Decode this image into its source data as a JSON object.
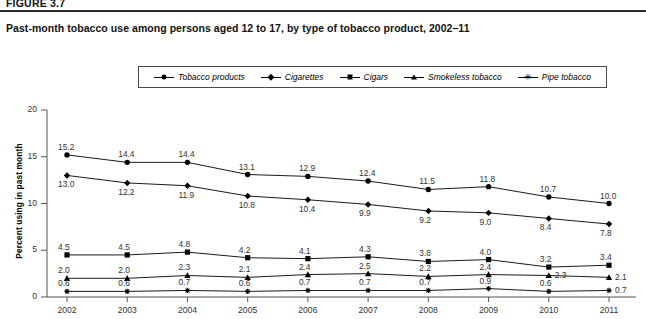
{
  "figure": {
    "label": "FIGURE 3.7",
    "title": "Past-month tobacco use among persons aged 12 to 17, by type of tobacco product, 2002–11"
  },
  "legend": {
    "position": "top-center",
    "items": [
      {
        "label": "Tobacco products",
        "marker": "circle-marker"
      },
      {
        "label": "Cigarettes",
        "marker": "diamond-marker"
      },
      {
        "label": "Cigars",
        "marker": "square-marker"
      },
      {
        "label": "Smokeless tobacco",
        "marker": "triangle-marker"
      },
      {
        "label": "Pipe tobacco",
        "marker": "star-marker"
      }
    ]
  },
  "chart_data": {
    "type": "line",
    "title": "Past-month tobacco use among persons aged 12 to 17, by type of tobacco product, 2002–11",
    "xlabel": "",
    "ylabel": "Percent using in past month",
    "categories": [
      "2002",
      "2003",
      "2004",
      "2005",
      "2006",
      "2007",
      "2008",
      "2009",
      "2010",
      "2011"
    ],
    "ylim": [
      0,
      20
    ],
    "yticks": [
      0,
      5,
      10,
      15,
      20
    ],
    "grid": false,
    "series": [
      {
        "name": "Tobacco products",
        "marker": "circle",
        "values": [
          15.2,
          14.4,
          14.4,
          13.1,
          12.9,
          12.4,
          11.5,
          11.8,
          10.7,
          10.0
        ]
      },
      {
        "name": "Cigarettes",
        "marker": "diamond",
        "values": [
          13.0,
          12.2,
          11.9,
          10.8,
          10.4,
          9.9,
          9.2,
          9.0,
          8.4,
          7.8
        ]
      },
      {
        "name": "Cigars",
        "marker": "square",
        "values": [
          4.5,
          4.5,
          4.8,
          4.2,
          4.1,
          4.3,
          3.8,
          4.0,
          3.2,
          3.4
        ]
      },
      {
        "name": "Smokeless tobacco",
        "marker": "triangle",
        "values": [
          2.0,
          2.0,
          2.3,
          2.1,
          2.4,
          2.5,
          2.2,
          2.4,
          2.3,
          2.1
        ]
      },
      {
        "name": "Pipe tobacco",
        "marker": "star",
        "values": [
          0.6,
          0.6,
          0.7,
          0.6,
          0.7,
          0.7,
          0.7,
          0.9,
          0.6,
          0.7
        ]
      }
    ]
  }
}
